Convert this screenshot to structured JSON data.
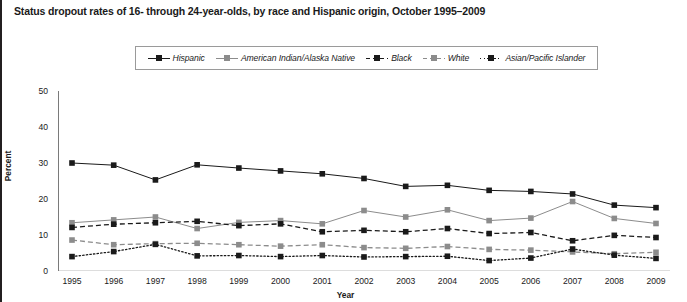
{
  "chart_data": {
    "type": "line",
    "title": "Status dropout rates of 16- through 24-year-olds, by race and Hispanic origin, October 1995–2009",
    "xlabel": "Year",
    "ylabel": "Percent",
    "ylim": [
      0,
      50
    ],
    "yticks": [
      0,
      10,
      20,
      30,
      40,
      50
    ],
    "grid": false,
    "legend_position": "top-center",
    "categories": [
      1995,
      1996,
      1997,
      1998,
      1999,
      2000,
      2001,
      2002,
      2003,
      2004,
      2005,
      2006,
      2007,
      2008,
      2009
    ],
    "xtick_labels": [
      "1995",
      "1996",
      "1997",
      "1998",
      "1999",
      "2000",
      "2001",
      "2002",
      "2003",
      "2004",
      "2005",
      "2006",
      "2007",
      "2008",
      "2009"
    ],
    "series": [
      {
        "name": "Hispanic",
        "color": "#1a1a1a",
        "line_style": "solid",
        "marker": "square",
        "values": [
          30.0,
          29.4,
          25.3,
          29.5,
          28.6,
          27.8,
          27.0,
          25.7,
          23.5,
          23.8,
          22.4,
          22.1,
          21.4,
          18.3,
          17.6
        ]
      },
      {
        "name": "American Indian/Alaska Native",
        "color": "#8c8c8c",
        "line_style": "solid",
        "marker": "square",
        "values": [
          13.4,
          14.2,
          15.0,
          11.8,
          13.5,
          14.0,
          13.1,
          16.8,
          15.0,
          17.0,
          14.0,
          14.7,
          19.3,
          14.6,
          13.2
        ]
      },
      {
        "name": "Black",
        "color": "#1a1a1a",
        "line_style": "dashed",
        "marker": "square",
        "values": [
          12.1,
          13.0,
          13.4,
          13.8,
          12.6,
          13.1,
          10.9,
          11.3,
          10.9,
          11.8,
          10.4,
          10.7,
          8.4,
          9.9,
          9.3
        ]
      },
      {
        "name": "White",
        "color": "#8c8c8c",
        "line_style": "dashed",
        "marker": "square",
        "values": [
          8.6,
          7.3,
          7.6,
          7.7,
          7.3,
          6.9,
          7.3,
          6.5,
          6.3,
          6.8,
          6.0,
          5.8,
          5.3,
          4.8,
          5.2
        ]
      },
      {
        "name": "Asian/Pacific Islander",
        "color": "#1a1a1a",
        "line_style": "dotted",
        "marker": "square",
        "values": [
          4.0,
          5.4,
          7.4,
          4.2,
          4.3,
          4.0,
          4.3,
          3.9,
          4.0,
          4.1,
          2.9,
          3.6,
          6.1,
          4.4,
          3.5
        ]
      }
    ]
  },
  "legend": {
    "items": [
      {
        "label": "Hispanic"
      },
      {
        "label": "American Indian/Alaska Native"
      },
      {
        "label": "Black"
      },
      {
        "label": "White"
      },
      {
        "label": "Asian/Pacific Islander"
      }
    ]
  }
}
